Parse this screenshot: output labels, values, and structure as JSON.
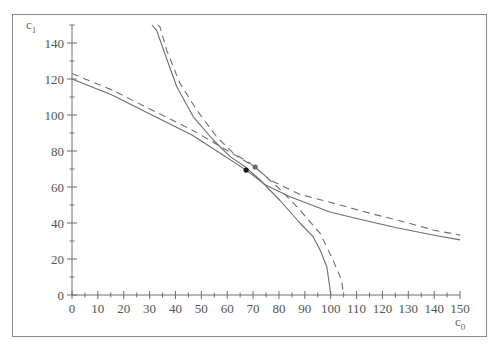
{
  "chart_data": {
    "type": "line",
    "title": "",
    "xlabel": "c0",
    "ylabel": "c1",
    "xlabel_main": "c",
    "xlabel_sub": "0",
    "ylabel_main": "c",
    "ylabel_sub": "1",
    "xlim": [
      0,
      150
    ],
    "ylim": [
      0,
      150
    ],
    "x_ticks": [
      0,
      10,
      20,
      30,
      40,
      50,
      60,
      70,
      80,
      90,
      100,
      110,
      120,
      130,
      140,
      150
    ],
    "y_ticks": [
      0,
      20,
      40,
      60,
      80,
      100,
      120,
      140
    ],
    "minor_x_step": 5,
    "minor_y_step": 10,
    "grid": false,
    "legend": null,
    "series": [
      {
        "name": "production possibility frontier (solid)",
        "style": "solid",
        "color": "#6e6e6e",
        "points": [
          [
            30.9,
            150
          ],
          [
            32.7,
            147
          ],
          [
            35.9,
            134
          ],
          [
            40.5,
            115.7
          ],
          [
            46.9,
            99
          ],
          [
            54.6,
            86.1
          ],
          [
            61.1,
            76.9
          ],
          [
            66.9,
            71.3
          ],
          [
            72.7,
            63.9
          ],
          [
            80.4,
            52.5
          ],
          [
            88.1,
            40
          ],
          [
            93.2,
            32.4
          ],
          [
            95.9,
            25
          ],
          [
            98.5,
            15.7
          ],
          [
            99.7,
            3.9
          ],
          [
            100,
            0
          ]
        ]
      },
      {
        "name": "production possibility frontier (dashed)",
        "style": "dashed",
        "color": "#6e6e6e",
        "points": [
          [
            33.2,
            150
          ],
          [
            34,
            149
          ],
          [
            36.6,
            136
          ],
          [
            41.7,
            117.6
          ],
          [
            48.2,
            102.8
          ],
          [
            55.9,
            87.9
          ],
          [
            62.4,
            78.7
          ],
          [
            68.8,
            73.2
          ],
          [
            74,
            67
          ],
          [
            81,
            58
          ],
          [
            88.1,
            47.2
          ],
          [
            95.9,
            34.3
          ],
          [
            100.9,
            19.4
          ],
          [
            104.2,
            8.3
          ],
          [
            104.8,
            1.8
          ],
          [
            105,
            0
          ]
        ]
      },
      {
        "name": "indifference curve (solid)",
        "style": "solid",
        "color": "#6e6e6e",
        "points": [
          [
            0,
            120
          ],
          [
            15.5,
            111.1
          ],
          [
            30.9,
            100
          ],
          [
            46.4,
            88.9
          ],
          [
            57,
            79
          ],
          [
            67.3,
            69.4
          ],
          [
            75,
            61
          ],
          [
            84.3,
            54.6
          ],
          [
            99.7,
            46.1
          ],
          [
            110,
            42.5
          ],
          [
            125,
            37.5
          ],
          [
            140,
            33.2
          ],
          [
            150,
            30.6
          ]
        ]
      },
      {
        "name": "indifference curve (dashed)",
        "style": "dashed",
        "color": "#6e6e6e",
        "points": [
          [
            0,
            123
          ],
          [
            15.5,
            113.9
          ],
          [
            30.9,
            102.8
          ],
          [
            46.4,
            91.7
          ],
          [
            58,
            82
          ],
          [
            70.8,
            71.1
          ],
          [
            76.5,
            63.9
          ],
          [
            88,
            56
          ],
          [
            103.6,
            50
          ],
          [
            115,
            45.5
          ],
          [
            130,
            40
          ],
          [
            140,
            36
          ],
          [
            150,
            33.3
          ]
        ]
      }
    ],
    "markers": [
      {
        "name": "optimum (solid)",
        "x": 67.3,
        "y": 69.4,
        "color": "#1a1a1a"
      },
      {
        "name": "optimum (dashed)",
        "x": 70.8,
        "y": 71.1,
        "color": "#6a6a6a"
      }
    ]
  },
  "layout": {
    "origin_px": [
      72,
      295
    ],
    "x_px_per_unit": 2.587,
    "y_px_per_unit": 1.8,
    "axis_color": "#6e6e6e"
  }
}
